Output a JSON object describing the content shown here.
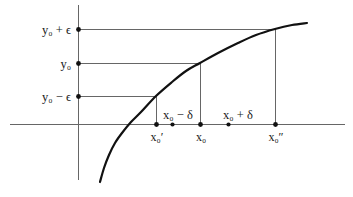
{
  "figure": {
    "colors": {
      "curve": "#111111",
      "axis": "#555555",
      "guide": "#555555",
      "dot": "#111111",
      "background": "#ffffff",
      "text": "#1a1a1a"
    }
  },
  "y_axis": {
    "labels": [
      {
        "id": "y0-plus-eps",
        "text": "y₀ + ϵ",
        "value": "y0+epsilon"
      },
      {
        "id": "y0",
        "text": "y₀",
        "value": "y0"
      },
      {
        "id": "y0-minus-eps",
        "text": "y₀ − ϵ",
        "value": "y0-epsilon"
      }
    ]
  },
  "x_axis": {
    "above_labels": [
      {
        "id": "x0-minus-delta",
        "text": "x₀ − δ",
        "value": "x0-delta"
      },
      {
        "id": "x0-plus-delta",
        "text": "x₀ + δ",
        "value": "x0+delta"
      }
    ],
    "below_labels": [
      {
        "id": "x0-prime",
        "text": "x₀′",
        "value": "x0'"
      },
      {
        "id": "x0",
        "text": "x₀",
        "value": "x0"
      },
      {
        "id": "x0-double-prime",
        "text": "x₀″",
        "value": "x0''"
      }
    ]
  },
  "chart_data": {
    "type": "line",
    "title": "",
    "xlabel": "",
    "ylabel": "",
    "grid": false,
    "legend": null,
    "xlim": [
      10,
      345
    ],
    "ylim": [
      5,
      190
    ],
    "series": [
      {
        "name": "f(x)",
        "shape": "increasing concave",
        "points": [
          [
            100,
            182
          ],
          [
            104,
            168
          ],
          [
            109,
            155
          ],
          [
            115,
            143
          ],
          [
            122,
            133
          ],
          [
            131,
            122
          ],
          [
            141,
            112
          ],
          [
            156,
            96
          ],
          [
            172,
            82
          ],
          [
            186,
            71
          ],
          [
            200,
            63
          ],
          [
            218,
            53
          ],
          [
            238,
            43
          ],
          [
            256,
            35
          ],
          [
            275,
            29
          ],
          [
            292,
            25
          ],
          [
            307,
            23
          ]
        ]
      }
    ],
    "axes": {
      "y_axis_x": 78,
      "x_axis_y": 124,
      "y_axis_top": 5,
      "y_axis_bottom": 180,
      "x_axis_left": 10,
      "x_axis_right": 345
    },
    "guide_lines_horizontal": [
      {
        "label": "y₀ + ϵ",
        "y": 29,
        "x_start": 78,
        "x_end": 275
      },
      {
        "label": "y₀",
        "y": 63,
        "x_start": 78,
        "x_end": 200
      },
      {
        "label": "y₀ − ϵ",
        "y": 96,
        "x_start": 78,
        "x_end": 156
      }
    ],
    "guide_lines_vertical": [
      {
        "label": "x₀′",
        "x": 156,
        "y_start": 96,
        "y_end": 124
      },
      {
        "label": "x₀",
        "x": 200,
        "y_start": 63,
        "y_end": 124
      },
      {
        "label": "x₀″",
        "x": 275,
        "y_start": 29,
        "y_end": 124
      }
    ],
    "y_axis_dots": [
      {
        "label": "y₀ + ϵ",
        "x": 78,
        "y": 29
      },
      {
        "label": "y₀",
        "x": 78,
        "y": 63
      },
      {
        "label": "y₀ − ϵ",
        "x": 78,
        "y": 96
      }
    ],
    "x_axis_dots": [
      {
        "label": "x₀′",
        "x": 156,
        "y": 124
      },
      {
        "label": "x₀ − δ",
        "x": 172,
        "y": 124
      },
      {
        "label": "x₀",
        "x": 200,
        "y": 124
      },
      {
        "label": "x₀ + δ",
        "x": 228,
        "y": 124
      },
      {
        "label": "x₀″",
        "x": 275,
        "y": 124
      }
    ],
    "label_positions": {
      "y0_plus_eps": {
        "x": 71,
        "y": 33,
        "anchor": "end"
      },
      "y0": {
        "x": 71,
        "y": 67,
        "anchor": "end"
      },
      "y0_minus_eps": {
        "x": 71,
        "y": 100,
        "anchor": "end"
      },
      "x0_minus_delta": {
        "x": 178,
        "y": 119,
        "anchor": "middle"
      },
      "x0_plus_delta": {
        "x": 238,
        "y": 119,
        "anchor": "middle"
      },
      "x0_prime": {
        "x": 157,
        "y": 141,
        "anchor": "middle"
      },
      "x0": {
        "x": 201,
        "y": 141,
        "anchor": "middle"
      },
      "x0_double_prime": {
        "x": 276,
        "y": 141,
        "anchor": "middle"
      }
    }
  }
}
